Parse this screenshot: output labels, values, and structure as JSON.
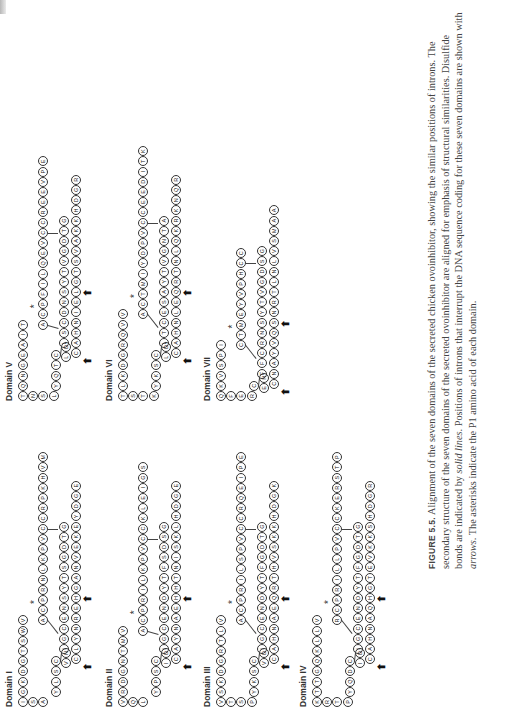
{
  "figure": {
    "label": "FIGURE 5.5.",
    "caption_parts": [
      {
        "text": " Alignment of the seven domains of the secreted chicken ovoinhibitor, showing the similar positions of introns. The secondary structure of the seven domains of the secreted ovoinhibitor are aligned for emphasis of structural similarities. Disulfide bonds are indicated by ",
        "italic": false
      },
      {
        "text": "solid lines",
        "italic": true
      },
      {
        "text": ". Positions of introns that interrupt the DNA sequence coding for these seven domains are shown with ",
        "italic": false
      },
      {
        "text": "arrows",
        "italic": true
      },
      {
        "text": ". The asterisks indicate the P1 amino acid of each domain.",
        "italic": false
      }
    ]
  },
  "domains": [
    {
      "name": "Domain I",
      "left_col": [
        "G",
        "S",
        "A"
      ],
      "top_row": [
        "I",
        "G",
        "K",
        "D",
        "G",
        "T",
        "S",
        "W",
        "V"
      ],
      "n_loop": [
        "Y",
        "L",
        "S",
        "C"
      ],
      "n_tail": [
        "V",
        "N"
      ],
      "p1_row": [
        "A",
        "C",
        "P",
        "R",
        "N",
        "L",
        "K",
        "P",
        "V",
        "C"
      ],
      "inner": [
        "I",
        "G",
        "C",
        "E",
        "N",
        "S",
        "Y",
        "T",
        "S",
        "G",
        "D",
        "T",
        "G"
      ],
      "bottom": [
        "C",
        "L",
        "Y",
        "N",
        "R",
        "E",
        "H",
        "G",
        "A",
        "N",
        "V",
        "E",
        "K",
        "E",
        "Y",
        "D",
        "G",
        "E"
      ],
      "tail": [
        "C",
        "R",
        "P",
        "K",
        "H",
        "V",
        "M"
      ],
      "arrows": 2
    },
    {
      "name": "Domain II",
      "left_col": [
        "V",
        "Q",
        "L"
      ],
      "top_row": [
        "V",
        "R",
        "D",
        "G",
        "N",
        "T",
        "M",
        "V"
      ],
      "n_loop": [
        "Y",
        "P",
        "S",
        "C"
      ],
      "n_tail": [
        "I",
        "D"
      ],
      "p1_row": [
        "A",
        "C",
        "P",
        "R",
        "I",
        "L",
        "K",
        "P",
        "V",
        "C"
      ],
      "inner": [
        "I",
        "G",
        "C",
        "E",
        "N",
        "D",
        "Y",
        "T",
        "F",
        "S",
        "D",
        "S",
        "G"
      ],
      "bottom": [
        "C",
        "A",
        "Y",
        "N",
        "A",
        "E",
        "H",
        "H",
        "T",
        "N",
        "I",
        "S",
        "K",
        "L",
        "H",
        "D",
        "G",
        "E"
      ],
      "tail": [
        "C",
        "K",
        "L",
        "E",
        "I",
        "G",
        "S"
      ],
      "arrows": 2
    },
    {
      "name": "Domain III",
      "left_col": [
        "V",
        "T",
        "S",
        "P"
      ],
      "top_row": [
        "V",
        "S",
        "K",
        "D",
        "G",
        "R",
        "T",
        "L",
        "V"
      ],
      "n_loop": [
        "Y",
        "K",
        "S",
        "C"
      ],
      "n_tail": [
        "V",
        "D"
      ],
      "p1_row": [
        "A",
        "C",
        "P",
        "R",
        "I",
        "L",
        "S",
        "P",
        "V",
        "C"
      ],
      "inner": [
        "I",
        "G",
        "C",
        "E",
        "N",
        "D",
        "Y",
        "T",
        "F",
        "G",
        "D",
        "T",
        "G"
      ],
      "bottom": [
        "C",
        "A",
        "H",
        "N",
        "A",
        "E",
        "Q",
        "R",
        "T",
        "H",
        "V",
        "S",
        "K",
        "K",
        "H",
        "D",
        "G",
        "K"
      ],
      "tail": [
        "C",
        "R",
        "Q",
        "E",
        "I",
        "P",
        "E"
      ],
      "arrows": 2
    },
    {
      "name": "Domain IV",
      "left_col": [
        "K",
        "R",
        "T",
        "P"
      ],
      "top_row": [
        "K",
        "T",
        "T",
        "G",
        "Q",
        "K",
        "L",
        "L",
        "V"
      ],
      "n_loop": [
        "Y",
        "Q",
        "D",
        "C"
      ],
      "n_tail": [
        "I",
        "D"
      ],
      "p1_row": [
        "R",
        "C",
        "P",
        "R",
        "I",
        "L",
        "L",
        "P",
        "V",
        "C"
      ],
      "inner": [
        "I",
        "G",
        "C",
        "E",
        "N",
        "D",
        "Y",
        "T",
        "F",
        "G",
        "D",
        "T",
        "G"
      ],
      "bottom": [
        "C",
        "A",
        "H",
        "N",
        "A",
        "Q",
        "H",
        "G",
        "T",
        "E",
        "V",
        "K",
        "K",
        "S",
        "H",
        "D",
        "G",
        "R"
      ],
      "tail": [
        "C",
        "K",
        "E",
        "R",
        "S",
        "T",
        "P"
      ],
      "arrows": 2
    },
    {
      "name": "Domain V",
      "left_col": [
        "T",
        "N",
        "S",
        "L"
      ],
      "top_row": [
        "T",
        "Q",
        "N",
        "G",
        "E",
        "A",
        "I",
        "T"
      ],
      "n_loop": [
        "Y",
        "Q",
        "T",
        "C"
      ],
      "n_tail": [
        "L",
        "D"
      ],
      "p1_row": [
        "A",
        "C",
        "P",
        "F",
        "I",
        "L",
        "Q",
        "E",
        "V",
        "C"
      ],
      "inner": [
        "L",
        "S",
        "C",
        "D",
        "N",
        "S",
        "Y",
        "T",
        "V",
        "G",
        "D",
        "T",
        "G"
      ],
      "bottom": [
        "C",
        "A",
        "H",
        "N",
        "I",
        "E",
        "L",
        "G",
        "T",
        "S",
        "V",
        "A",
        "K",
        "K",
        "H",
        "D",
        "G",
        "R"
      ],
      "tail": [
        "C",
        "R",
        "E",
        "E",
        "V",
        "P",
        "E"
      ],
      "arrows": 2
    },
    {
      "name": "Domain VI",
      "left_col": [
        "T",
        "S",
        "T",
        "K"
      ],
      "top_row": [
        "T",
        "L",
        "K",
        "D",
        "G",
        "R",
        "Q",
        "V",
        "V"
      ],
      "n_loop": [
        "Y",
        "K",
        "S",
        "C"
      ],
      "n_tail": [
        "L",
        "D"
      ],
      "p1_row": [
        "A",
        "C",
        "T",
        "M",
        "I",
        "Y",
        "D",
        "P",
        "V",
        "C"
      ],
      "inner": [
        "L",
        "T",
        "C",
        "E",
        "S",
        "A",
        "Y",
        "T",
        "V",
        "G",
        "N",
        "T",
        "A"
      ],
      "bottom": [
        "C",
        "A",
        "H",
        "N",
        "L",
        "E",
        "Q",
        "R",
        "T",
        "N",
        "L",
        "Q",
        "K",
        "R",
        "K",
        "N",
        "Q",
        "R"
      ],
      "tail": [
        "C",
        "E",
        "E",
        "D",
        "I",
        "T",
        "K"
      ],
      "arrows": 2
    },
    {
      "name": "Domain VII",
      "left_col": [
        "Q",
        "F",
        "E",
        "R"
      ],
      "top_row": [
        "Q",
        "K",
        "V",
        "S",
        "P",
        "I"
      ],
      "n_loop": [
        "C"
      ],
      "n_tail": [
        "E",
        "H"
      ],
      "p1_row": [
        "C",
        "T",
        "M",
        "E",
        "Y",
        "V",
        "P",
        "H",
        "C"
      ],
      "inner": [
        "F",
        "F",
        "C",
        "R",
        "N",
        "S",
        "Y",
        "T",
        "V",
        "G",
        "D",
        "S",
        "G"
      ],
      "bottom": [
        "C",
        "N",
        "A",
        "Y",
        "V",
        "Q",
        "S",
        "N",
        "R",
        "T",
        "L",
        "N",
        "L",
        "V",
        "S",
        "M",
        "A",
        "A"
      ],
      "tail": [
        "C"
      ],
      "arrows": 2
    }
  ],
  "annotations": {
    "asterisk": "*",
    "arrow": "⬅"
  }
}
